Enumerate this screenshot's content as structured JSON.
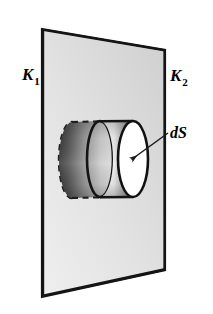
{
  "figure": {
    "name": "gaussian-pillbox-across-plane-interface",
    "background_color": "#ffffff",
    "width": 213,
    "height": 314,
    "labels": {
      "left_region": {
        "base": "K",
        "subscript": "1",
        "text": "K1",
        "x": 24,
        "y": 79
      },
      "right_region": {
        "base": "K",
        "subscript": "2",
        "text": "K2",
        "x": 170,
        "y": 80
      },
      "area_element": {
        "text": "dS",
        "x": 172,
        "y": 138
      }
    },
    "colors": {
      "outline": "#1a1a1a",
      "plane_fill_light": "#e3e3e3",
      "plane_fill_dark": "#c9c9c9",
      "cylinder_rear_dark": "#4a4a4a",
      "cylinder_rear_light": "#d8d8d8",
      "cylinder_front_light": "#f2f2f2",
      "cylinder_front_shadow": "#8d8d8d",
      "front_face_fill": "#ffffff",
      "arrow_color": "#1a1a1a"
    },
    "plane": {
      "name": "dielectric-boundary-plane",
      "corners": [
        {
          "x": 42,
          "y": 29
        },
        {
          "x": 165,
          "y": 50
        },
        {
          "x": 165,
          "y": 270
        },
        {
          "x": 42,
          "y": 297
        }
      ]
    },
    "cylinder": {
      "name": "gaussian-pillbox",
      "rear_face": {
        "cx": 72,
        "cy": 160,
        "rx": 13,
        "ry": 38,
        "style": "dashed"
      },
      "mid_section": {
        "cx": 100,
        "cy": 159,
        "rx": 13,
        "ry": 38,
        "style": "solid"
      },
      "front_face": {
        "cx": 133,
        "cy": 159,
        "rx": 15,
        "ry": 38,
        "style": "solid",
        "fill": "white"
      }
    },
    "arrow": {
      "name": "ds-pointer-arrow",
      "from": {
        "x": 168,
        "y": 133
      },
      "to": {
        "x": 131,
        "y": 160
      }
    }
  }
}
